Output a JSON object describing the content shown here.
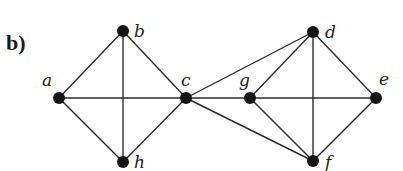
{
  "figure": {
    "panel_label": "b)",
    "colors": {
      "edge": "#2b2b2b",
      "node": "#151515",
      "label": "#222222",
      "background": "#ffffff"
    }
  },
  "graph": {
    "vertices": [
      {
        "id": "a",
        "label": "a",
        "x": 59,
        "y": 98,
        "label_x": 42,
        "label_y": 86
      },
      {
        "id": "b",
        "label": "b",
        "x": 123,
        "y": 31,
        "label_x": 134,
        "label_y": 37
      },
      {
        "id": "c",
        "label": "c",
        "x": 186,
        "y": 98,
        "label_x": 181,
        "label_y": 86
      },
      {
        "id": "g",
        "label": "g",
        "x": 250,
        "y": 98,
        "label_x": 239,
        "label_y": 86
      },
      {
        "id": "d",
        "label": "d",
        "x": 313,
        "y": 32,
        "label_x": 325,
        "label_y": 38
      },
      {
        "id": "e",
        "label": "e",
        "x": 376,
        "y": 98,
        "label_x": 379,
        "label_y": 85
      },
      {
        "id": "f",
        "label": "f",
        "x": 313,
        "y": 161,
        "label_x": 325,
        "label_y": 168
      },
      {
        "id": "h",
        "label": "h",
        "x": 123,
        "y": 162,
        "label_x": 134,
        "label_y": 168
      }
    ],
    "edges": [
      [
        "a",
        "b"
      ],
      [
        "a",
        "c"
      ],
      [
        "a",
        "h"
      ],
      [
        "b",
        "c"
      ],
      [
        "b",
        "h"
      ],
      [
        "c",
        "h"
      ],
      [
        "c",
        "d"
      ],
      [
        "c",
        "g"
      ],
      [
        "c",
        "f"
      ],
      [
        "d",
        "g"
      ],
      [
        "d",
        "e"
      ],
      [
        "d",
        "f"
      ],
      [
        "g",
        "e"
      ],
      [
        "g",
        "f"
      ],
      [
        "e",
        "f"
      ]
    ]
  }
}
